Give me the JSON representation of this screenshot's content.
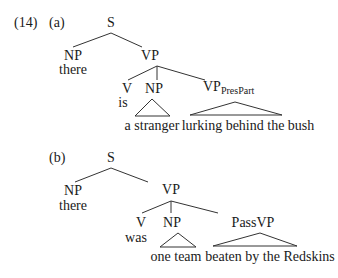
{
  "example": {
    "number": "(14)",
    "a": {
      "label": "(a)",
      "S": "S",
      "NP": "NP",
      "NP_word": "there",
      "VP": "VP",
      "V": "V",
      "V_word": "is",
      "NP2": "NP",
      "NP2_words": "a stranger",
      "VP_PresPart_main": "VP",
      "VP_PresPart_sub": "PresPart",
      "VP_PresPart_words": "lurking behind the bush"
    },
    "b": {
      "label": "(b)",
      "S": "S",
      "NP": "NP",
      "NP_word": "there",
      "VP": "VP",
      "V": "V",
      "V_word": "was",
      "NP2": "NP",
      "NP2_words": "one team",
      "PassVP": "PassVP",
      "PassVP_words": "beaten by the Redskins"
    }
  }
}
